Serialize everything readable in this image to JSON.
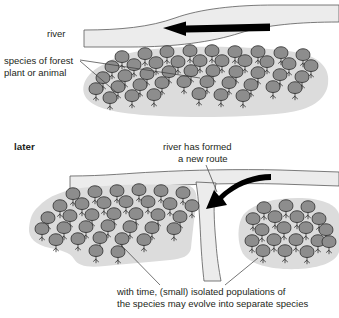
{
  "diagram": {
    "title_visible": false,
    "type": "allopatric-speciation-illustration",
    "panels": [
      {
        "id": "before",
        "stage_label": "",
        "labels": [
          {
            "id": "river",
            "text": "river"
          },
          {
            "id": "species",
            "text": "species of forest\nplant or animal",
            "line1": "species of forest",
            "line2": "plant or animal"
          }
        ]
      },
      {
        "id": "later",
        "stage_label": "later",
        "labels": [
          {
            "id": "new-route",
            "line1": "river has formed",
            "line2": "a new route"
          },
          {
            "id": "caption",
            "line1": "with time, (small) isolated populations of",
            "line2": "the species may evolve into separate species"
          }
        ]
      }
    ]
  },
  "text": {
    "river": "river",
    "species_line1": "species of forest",
    "species_line2": "plant or animal",
    "later": "later",
    "new_route_line1": "river has formed",
    "new_route_line2": "a new route",
    "caption_line1": "with time, (small) isolated populations of",
    "caption_line2": "the species may evolve into separate species"
  },
  "colors": {
    "background": "#ffffff",
    "river_fill": "#ececec",
    "river_stroke": "#5a5a5a",
    "habitat_fill": "#dcdcdc",
    "tree_fill": "#8d8d8d",
    "tree_stroke": "#2b2b2b",
    "text": "#231f20",
    "arrow": "#000000",
    "leader_line": "#3a3a3a"
  },
  "icons": {
    "flow_arrow_top": "left-arrow-icon",
    "flow_arrow_fork": "curved-arrow-icon"
  },
  "forests": {
    "top": {
      "name": "forest-patch-continuous",
      "tree_count": 46,
      "trees": [
        [
          122,
          62
        ],
        [
          145,
          59
        ],
        [
          167,
          57
        ],
        [
          190,
          56
        ],
        [
          212,
          56
        ],
        [
          235,
          57
        ],
        [
          258,
          57
        ],
        [
          281,
          58
        ],
        [
          303,
          60
        ],
        [
          112,
          72
        ],
        [
          134,
          70
        ],
        [
          156,
          68
        ],
        [
          178,
          67
        ],
        [
          200,
          66
        ],
        [
          222,
          66
        ],
        [
          245,
          66
        ],
        [
          267,
          67
        ],
        [
          289,
          69
        ],
        [
          311,
          71
        ],
        [
          103,
          83
        ],
        [
          125,
          81
        ],
        [
          147,
          79
        ],
        [
          169,
          77
        ],
        [
          191,
          76
        ],
        [
          213,
          76
        ],
        [
          236,
          77
        ],
        [
          258,
          78
        ],
        [
          280,
          80
        ],
        [
          302,
          82
        ],
        [
          96,
          94
        ],
        [
          118,
          92
        ],
        [
          140,
          90
        ],
        [
          162,
          88
        ],
        [
          184,
          87
        ],
        [
          207,
          87
        ],
        [
          229,
          88
        ],
        [
          251,
          90
        ],
        [
          273,
          92
        ],
        [
          295,
          93
        ],
        [
          110,
          103
        ],
        [
          132,
          101
        ],
        [
          154,
          100
        ],
        [
          199,
          99
        ],
        [
          221,
          100
        ],
        [
          243,
          101
        ]
      ]
    },
    "lower_left": {
      "name": "forest-patch-west",
      "tree_count": 34,
      "trees": [
        [
          73,
          199
        ],
        [
          95,
          197
        ],
        [
          117,
          196
        ],
        [
          139,
          195
        ],
        [
          161,
          196
        ],
        [
          183,
          198
        ],
        [
          60,
          211
        ],
        [
          82,
          209
        ],
        [
          104,
          208
        ],
        [
          126,
          207
        ],
        [
          148,
          207
        ],
        [
          170,
          209
        ],
        [
          192,
          211
        ],
        [
          48,
          223
        ],
        [
          70,
          221
        ],
        [
          92,
          220
        ],
        [
          114,
          219
        ],
        [
          136,
          219
        ],
        [
          158,
          220
        ],
        [
          180,
          222
        ],
        [
          42,
          234
        ],
        [
          64,
          233
        ],
        [
          86,
          232
        ],
        [
          108,
          231
        ],
        [
          130,
          232
        ],
        [
          152,
          233
        ],
        [
          174,
          234
        ],
        [
          56,
          245
        ],
        [
          78,
          244
        ],
        [
          100,
          243
        ],
        [
          122,
          244
        ],
        [
          144,
          245
        ],
        [
          96,
          256
        ],
        [
          118,
          257
        ]
      ]
    },
    "lower_right": {
      "name": "forest-patch-east",
      "tree_count": 19,
      "trees": [
        [
          264,
          213
        ],
        [
          286,
          211
        ],
        [
          308,
          212
        ],
        [
          253,
          224
        ],
        [
          275,
          222
        ],
        [
          297,
          222
        ],
        [
          319,
          224
        ],
        [
          262,
          235
        ],
        [
          284,
          233
        ],
        [
          306,
          233
        ],
        [
          326,
          235
        ],
        [
          252,
          246
        ],
        [
          274,
          245
        ],
        [
          296,
          245
        ],
        [
          318,
          246
        ],
        [
          263,
          256
        ],
        [
          285,
          256
        ],
        [
          307,
          257
        ],
        [
          329,
          247
        ]
      ]
    }
  },
  "chart_data": {
    "type": "diagram",
    "stages": [
      {
        "stage": "before",
        "description": "A single continuous forest population lies beside a river that flows from right to left.",
        "river_direction": "right-to-left",
        "populations": 1
      },
      {
        "stage": "later",
        "description": "The river has formed a new route that cuts through the forest, splitting it into two isolated populations.",
        "river_direction": "right-to-left with new southward branch",
        "populations": 2
      }
    ]
  }
}
